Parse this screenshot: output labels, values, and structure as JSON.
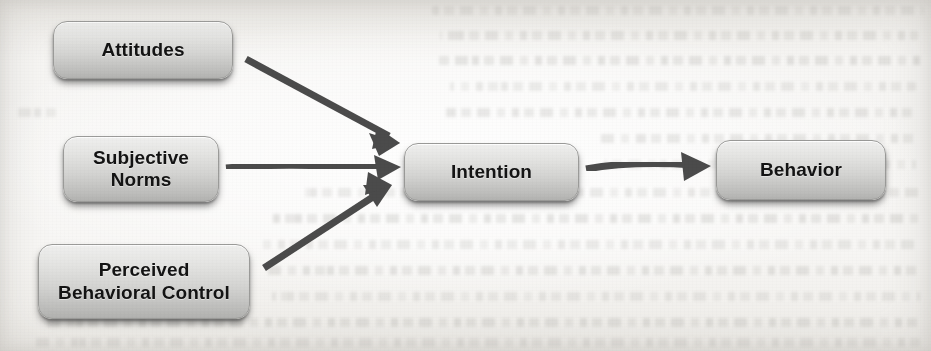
{
  "figure": {
    "background_color": "#f4f3f1",
    "node_fill_top": "#efefee",
    "node_fill_bottom": "#b2b2b0",
    "node_border_color": "#9b9b99",
    "arrow_color": "#4b4b4b",
    "label_color": "#141414"
  },
  "nodes": [
    {
      "id": "attitudes",
      "label": "Attitudes",
      "label_line1": "Attitudes",
      "label_line2": ""
    },
    {
      "id": "subjective_norms",
      "label": "Subjective Norms",
      "label_line1": "Subjective",
      "label_line2": "Norms"
    },
    {
      "id": "pbc",
      "label": "Perceived Behavioral Control",
      "label_line1": "Perceived",
      "label_line2": "Behavioral Control"
    },
    {
      "id": "intention",
      "label": "Intention",
      "label_line1": "Intention",
      "label_line2": ""
    },
    {
      "id": "behavior",
      "label": "Behavior",
      "label_line1": "Behavior",
      "label_line2": ""
    }
  ],
  "edges": [
    {
      "id": "attitudes-to-intention",
      "from": "Attitudes",
      "to": "Intention",
      "style": "solid-arrow",
      "direction": "down-right"
    },
    {
      "id": "subjective-norms-to-intention",
      "from": "Subjective Norms",
      "to": "Intention",
      "style": "solid-arrow",
      "direction": "right"
    },
    {
      "id": "pbc-to-intention",
      "from": "Perceived Behavioral Control",
      "to": "Intention",
      "style": "solid-arrow",
      "direction": "up-right"
    },
    {
      "id": "intention-to-behavior",
      "from": "Intention",
      "to": "Behavior",
      "style": "solid-arrow",
      "direction": "right"
    }
  ],
  "ghost_text": {
    "description": "Faint bleed-through text from the reverse side of the scanned page; illegible.",
    "lines": [
      {
        "top": 6,
        "left": 432,
        "width": 492
      },
      {
        "top": 31,
        "left": 440,
        "width": 478
      },
      {
        "top": 56,
        "left": 438,
        "width": 486
      },
      {
        "top": 82,
        "left": 450,
        "width": 466
      },
      {
        "top": 108,
        "left": 444,
        "width": 472
      },
      {
        "top": 108,
        "left": 12,
        "width": 44
      },
      {
        "top": 134,
        "left": 600,
        "width": 318
      },
      {
        "top": 160,
        "left": 604,
        "width": 312
      },
      {
        "top": 188,
        "left": 300,
        "width": 620
      },
      {
        "top": 214,
        "left": 268,
        "width": 652
      },
      {
        "top": 240,
        "left": 262,
        "width": 658
      },
      {
        "top": 266,
        "left": 266,
        "width": 654
      },
      {
        "top": 292,
        "left": 272,
        "width": 648
      },
      {
        "top": 318,
        "left": 44,
        "width": 876
      },
      {
        "top": 338,
        "left": 30,
        "width": 890
      }
    ]
  }
}
